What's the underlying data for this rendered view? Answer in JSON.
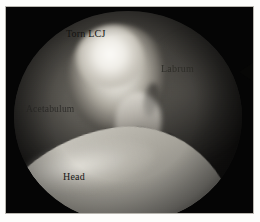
{
  "figure": {
    "type": "arthroscopic-photograph",
    "modality": "hip arthroscopy",
    "frame_border_color": "#b9b7b0",
    "background_color": "#000000",
    "field_shape": "circle"
  },
  "labels": {
    "torn_lcj": "Torn LCJ",
    "labrum": "Labrum",
    "acetabulum": "Acetabulum",
    "head": "Head"
  },
  "structures": [
    {
      "name": "torn-ligament-tissue",
      "label": "Torn LCJ",
      "appearance": "bright irregular fibrillated mass",
      "position": "upper-center"
    },
    {
      "name": "labrum",
      "label": "Labrum",
      "appearance": "dark shaded rim tissue",
      "position": "right"
    },
    {
      "name": "acetabulum",
      "label": "Acetabulum",
      "appearance": "dull gray socket wall",
      "position": "left"
    },
    {
      "name": "femoral-head",
      "label": "Head",
      "appearance": "smooth light gray convex cartilage surface",
      "position": "lower-left"
    }
  ],
  "markers": {
    "arrow_notch": "arrow-marker at right rim"
  }
}
